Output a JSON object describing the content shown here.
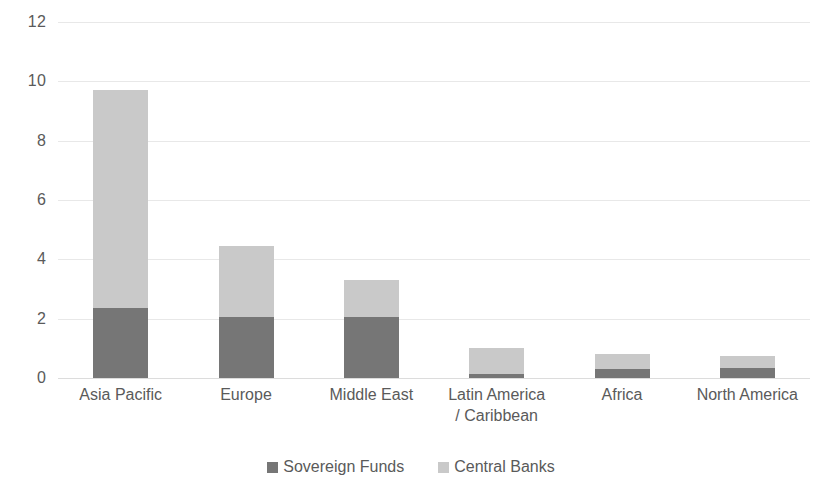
{
  "chart_data": {
    "type": "bar",
    "stacked": true,
    "title": "",
    "subtitle": "",
    "xlabel": "",
    "ylabel": "",
    "ylim": [
      0,
      12
    ],
    "ytick_labels": [
      "12",
      "10",
      "8",
      "6",
      "4",
      "2",
      "0"
    ],
    "yticks": [
      12,
      10,
      8,
      6,
      4,
      2,
      0
    ],
    "grid": true,
    "legend_position": "bottom",
    "categories": [
      "Asia Pacific",
      "Europe",
      "Middle East",
      "Latin America\n/ Caribbean",
      "Africa",
      "North America"
    ],
    "series": [
      {
        "name": "Sovereign Funds",
        "color": "#767676",
        "values": [
          2.35,
          2.05,
          2.05,
          0.15,
          0.3,
          0.35
        ]
      },
      {
        "name": "Central Banks",
        "color": "#c9c9c9",
        "values": [
          7.35,
          2.4,
          1.25,
          0.85,
          0.5,
          0.4
        ]
      }
    ],
    "totals": [
      9.7,
      4.45,
      3.3,
      1.0,
      0.8,
      0.75
    ]
  },
  "legend": {
    "items": [
      {
        "label": "Sovereign Funds",
        "color": "#767676"
      },
      {
        "label": "Central Banks",
        "color": "#c9c9c9"
      }
    ]
  },
  "colors": {
    "sovereign_funds": "#767676",
    "central_banks": "#c9c9c9",
    "gridline": "#e8e8e8",
    "text": "#5a5a5a",
    "background": "#ffffff"
  }
}
